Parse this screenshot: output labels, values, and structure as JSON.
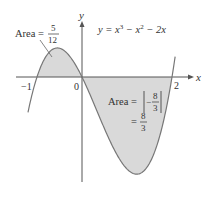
{
  "chart_data": {
    "type": "line",
    "title": "",
    "equation": "y = x³ − x² − 2x",
    "xlabel": "x",
    "ylabel": "y",
    "x_ticks": [
      "−1",
      "0",
      "2"
    ],
    "roots": [
      -1,
      0,
      2
    ],
    "shaded_regions": [
      {
        "interval": [
          -1,
          0
        ],
        "label": "Area = 5/12",
        "value": "5/12",
        "sign": "positive"
      },
      {
        "interval": [
          0,
          2
        ],
        "label": "Area = |−8/3| = 8/3",
        "value": "8/3",
        "sign": "negative"
      }
    ],
    "series": [
      {
        "name": "y = x^3 - x^2 - 2x",
        "x_range": [
          -1.2,
          2.07
        ]
      }
    ],
    "colors": {
      "fill": "#d9d9d9",
      "curve": "#777777",
      "axes": "#555555"
    }
  },
  "labels": {
    "y_axis": "y",
    "x_axis": "x",
    "tick_neg1": "−1",
    "tick_0": "0",
    "tick_2": "2",
    "equation_lhs": "y = x",
    "eq_exp3": "3",
    "eq_mid": " − x",
    "eq_exp2": "2",
    "eq_end": " − 2x",
    "area_left_prefix": "Area =",
    "area_left_num": "5",
    "area_left_den": "12",
    "area_right_prefix": "Area =",
    "area_right_num": "8",
    "area_right_den": "3",
    "area_right_minus": "−",
    "area_right_eq": "=",
    "area_right_result_num": "8",
    "area_right_result_den": "3"
  }
}
